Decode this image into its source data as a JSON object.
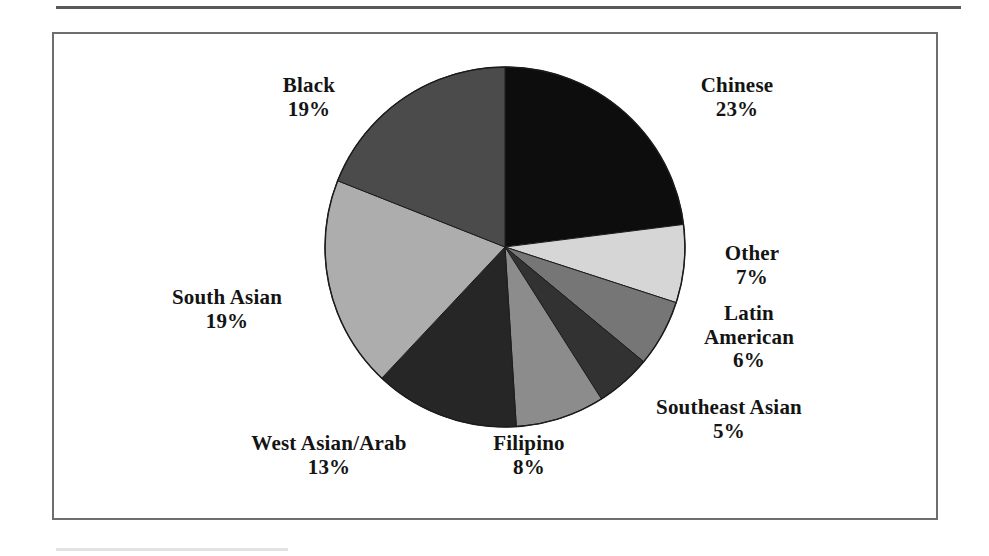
{
  "figure": {
    "frame_color": "#6e6e6e",
    "background": "#ffffff",
    "rule_color": "#5a5a5a"
  },
  "chart_data": {
    "type": "pie",
    "title": "",
    "subtitle": "",
    "xlabel": "",
    "ylabel": "",
    "grid": false,
    "legend_position": "none",
    "label_format": "name above percent",
    "start_angle_deg": 0,
    "direction": "clockwise",
    "total_percent": 100,
    "categories": [
      "Chinese",
      "Other",
      "Latin American",
      "Southeast Asian",
      "Filipino",
      "West Asian/Arab",
      "South Asian",
      "Black"
    ],
    "values": [
      23,
      7,
      6,
      5,
      8,
      13,
      19,
      19
    ],
    "slices": [
      {
        "name": "Chinese",
        "name_lines": [
          "Chinese"
        ],
        "value": 23,
        "percent_label": "23%",
        "color": "#0d0d0d"
      },
      {
        "name": "Other",
        "name_lines": [
          "Other"
        ],
        "value": 7,
        "percent_label": "7%",
        "color": "#d6d6d6"
      },
      {
        "name": "Latin American",
        "name_lines": [
          "Latin",
          "American"
        ],
        "value": 6,
        "percent_label": "6%",
        "color": "#767676"
      },
      {
        "name": "Southeast Asian",
        "name_lines": [
          "Southeast Asian"
        ],
        "value": 5,
        "percent_label": "5%",
        "color": "#323232"
      },
      {
        "name": "Filipino",
        "name_lines": [
          "Filipino"
        ],
        "value": 8,
        "percent_label": "8%",
        "color": "#8c8c8c"
      },
      {
        "name": "West Asian/Arab",
        "name_lines": [
          "West Asian/Arab"
        ],
        "value": 13,
        "percent_label": "13%",
        "color": "#262626"
      },
      {
        "name": "South Asian",
        "name_lines": [
          "South Asian"
        ],
        "value": 19,
        "percent_label": "19%",
        "color": "#adadad"
      },
      {
        "name": "Black",
        "name_lines": [
          "Black"
        ],
        "value": 19,
        "percent_label": "19%",
        "color": "#4b4b4b"
      }
    ]
  },
  "labels": {
    "chinese": {
      "name": "Chinese",
      "percent": "23%"
    },
    "other": {
      "name": "Other",
      "percent": "7%"
    },
    "latin_american": {
      "name1": "Latin",
      "name2": "American",
      "percent": "6%"
    },
    "southeast_asian": {
      "name": "Southeast Asian",
      "percent": "5%"
    },
    "filipino": {
      "name": "Filipino",
      "percent": "8%"
    },
    "west_asian_arab": {
      "name": "West Asian/Arab",
      "percent": "13%"
    },
    "south_asian": {
      "name": "South Asian",
      "percent": "19%"
    },
    "black": {
      "name": "Black",
      "percent": "19%"
    }
  }
}
